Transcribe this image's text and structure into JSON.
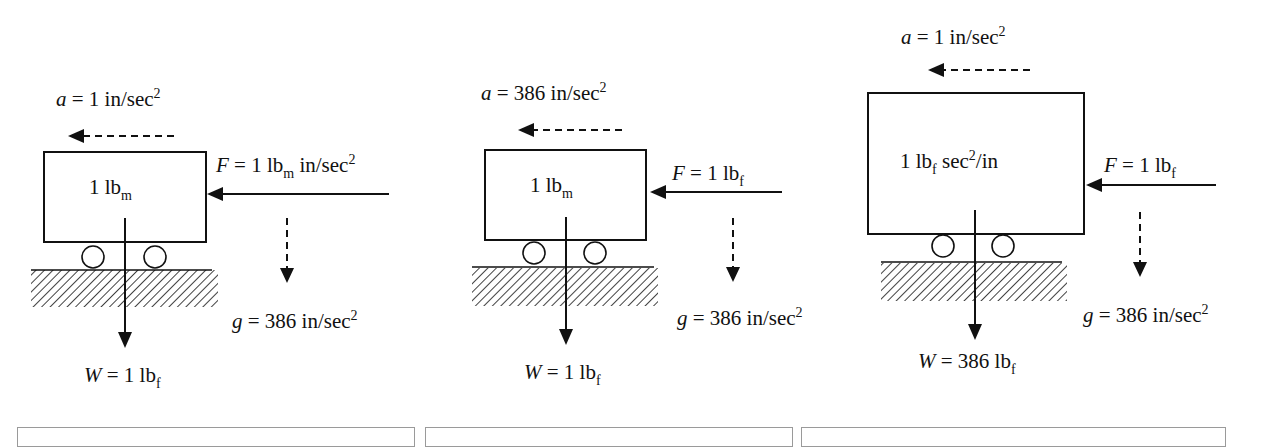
{
  "diagram": {
    "panels": [
      {
        "id": "panel-lbm-poundal-like",
        "acceleration": {
          "symbol": "a",
          "eq": " = 1 in/sec",
          "sup": "2"
        },
        "mass": {
          "value": "1 lb",
          "sub": "m",
          "tail": ""
        },
        "force": {
          "symbol": "F",
          "eq": " = 1 lb",
          "sub": "m",
          "tail": " in/sec",
          "sup": "2"
        },
        "gravity": {
          "symbol": "g",
          "eq": " = 386 in/sec",
          "sup": "2"
        },
        "weight": {
          "symbol": "W",
          "eq": " = 1 lb",
          "sub": "f"
        }
      },
      {
        "id": "panel-lbm-lbf",
        "acceleration": {
          "symbol": "a",
          "eq": " = 386 in/sec",
          "sup": "2"
        },
        "mass": {
          "value": "1 lb",
          "sub": "m",
          "tail": ""
        },
        "force": {
          "symbol": "F",
          "eq": " = 1 lb",
          "sub": "f",
          "tail": "",
          "sup": ""
        },
        "gravity": {
          "symbol": "g",
          "eq": " = 386 in/sec",
          "sup": "2"
        },
        "weight": {
          "symbol": "W",
          "eq": " = 1 lb",
          "sub": "f"
        }
      },
      {
        "id": "panel-lbf-sec2-in",
        "acceleration": {
          "symbol": "a",
          "eq": " = 1 in/sec",
          "sup": "2"
        },
        "mass": {
          "value": "1 lb",
          "sub": "f",
          "tail": " sec",
          "sup": "2",
          "tail2": "/in"
        },
        "force": {
          "symbol": "F",
          "eq": " = 1 lb",
          "sub": "f",
          "tail": "",
          "sup": ""
        },
        "gravity": {
          "symbol": "g",
          "eq": " = 386 in/sec",
          "sup": "2"
        },
        "weight": {
          "symbol": "W",
          "eq": " = 386 lb",
          "sub": "f"
        }
      }
    ],
    "icons": {
      "acceleration_arrow": "dashed-left-arrow",
      "force_arrow": "solid-left-arrow",
      "gravity_arrow": "dashed-down-arrow",
      "weight_arrow": "solid-down-arrow",
      "wheel": "circle",
      "ground": "hatched-ground"
    },
    "colors": {
      "ink": "#111111",
      "background": "#ffffff",
      "caption_box_border": "#9a9a9a"
    },
    "caption_boxes": [
      "",
      "",
      ""
    ]
  }
}
